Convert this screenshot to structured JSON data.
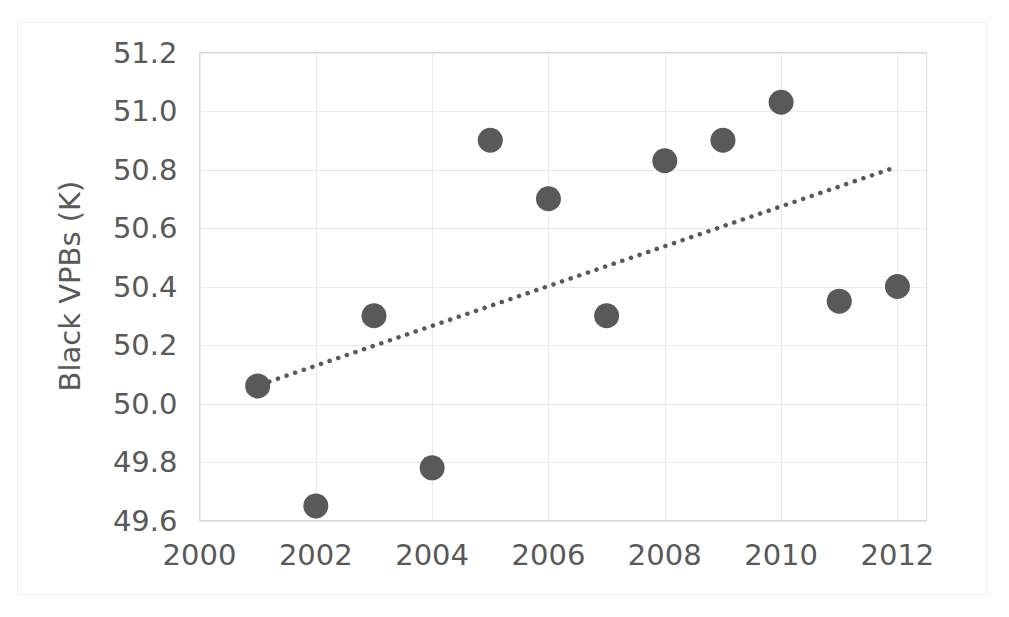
{
  "chart_data": {
    "type": "scatter",
    "title": "",
    "xlabel": "",
    "ylabel": "Black VPBs (K)",
    "xlim": [
      2000,
      2012.5
    ],
    "ylim": [
      49.6,
      51.2
    ],
    "grid": true,
    "legend": false,
    "x_ticks": [
      "2000",
      "2002",
      "2004",
      "2006",
      "2008",
      "2010",
      "2012"
    ],
    "x_tick_values": [
      2000,
      2002,
      2004,
      2006,
      2008,
      2010,
      2012
    ],
    "y_ticks": [
      "49.6",
      "49.8",
      "50.0",
      "50.2",
      "50.4",
      "50.6",
      "50.8",
      "51.0",
      "51.2"
    ],
    "y_tick_values": [
      49.6,
      49.8,
      50.0,
      50.2,
      50.4,
      50.6,
      50.8,
      51.0,
      51.2
    ],
    "series": [
      {
        "name": "Black VPBs (K)",
        "marker": "circle",
        "color": "#595959",
        "x": [
          2001,
          2002,
          2003,
          2004,
          2005,
          2006,
          2007,
          2008,
          2009,
          2010,
          2011,
          2012
        ],
        "values": [
          50.06,
          49.65,
          50.3,
          49.78,
          50.9,
          50.7,
          50.3,
          50.83,
          50.9,
          51.03,
          50.35,
          50.4
        ]
      },
      {
        "name": "Linear trendline",
        "type": "line",
        "style": "dotted",
        "color": "#595959",
        "x": [
          2001.2,
          2012.0
        ],
        "values": [
          50.075,
          50.81
        ]
      }
    ]
  },
  "axis": {
    "y_title": "Black VPBs (K)"
  }
}
